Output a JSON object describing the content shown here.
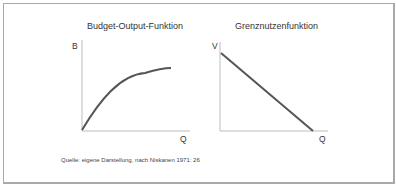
{
  "figure": {
    "left_chart": {
      "title": "Budget-Output-Funktion",
      "y_label": "B",
      "x_label": "Q",
      "curve": "concave increasing"
    },
    "right_chart": {
      "title": "Grenznutzenfunktion",
      "y_label": "V",
      "x_label": "Q",
      "curve": "linear decreasing"
    },
    "source": "Quelle: eigene Darstellung, nach Niskanen 1971: 26"
  },
  "colors": {
    "axis": "#bdbdbd",
    "curve": "#555555",
    "border": "#a9a9a9"
  }
}
